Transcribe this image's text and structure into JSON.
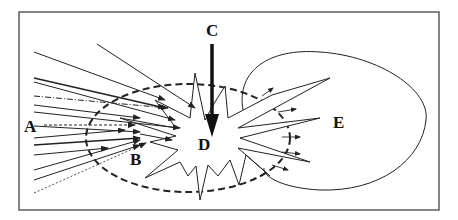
{
  "diagram": {
    "labels": {
      "A": "A",
      "B": "B",
      "C": "C",
      "D": "D",
      "E": "E"
    },
    "colors": {
      "stroke": "#222222",
      "frame": "#444444",
      "background": "#ffffff"
    }
  }
}
